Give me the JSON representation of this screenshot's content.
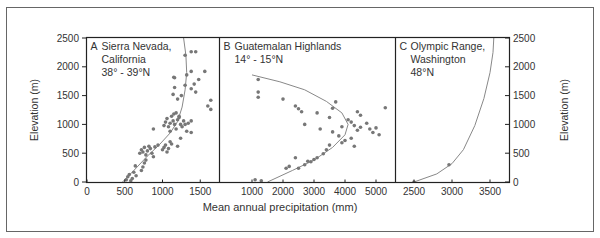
{
  "figure": {
    "xlabel": "Mean annual precipitation (mm)",
    "ylabel_left": "Elevation (m)",
    "ylabel_right": "Elevation (m)",
    "y_ticks": [
      0,
      500,
      1000,
      1500,
      2000,
      2500
    ],
    "colors": {
      "frame": "#555555",
      "axis": "#222222",
      "point": "#777777",
      "curve": "#888888",
      "text": "#333333"
    }
  },
  "chart_data": [
    {
      "type": "scatter",
      "panel": "A",
      "title": "Sierra Nevada, California",
      "subtitle": "38° - 39°N",
      "xlabel": "Mean annual precipitation (mm)",
      "ylabel": "Elevation (m)",
      "xlim": [
        0,
        1750
      ],
      "ylim": [
        0,
        2500
      ],
      "x_ticks": [
        0,
        500,
        1000,
        1500
      ],
      "y_ticks": [
        0,
        500,
        1000,
        1500,
        2000,
        2500
      ],
      "points": [
        [
          520,
          40
        ],
        [
          540,
          90
        ],
        [
          560,
          130
        ],
        [
          580,
          20
        ],
        [
          600,
          60
        ],
        [
          620,
          170
        ],
        [
          650,
          110
        ],
        [
          640,
          280
        ],
        [
          720,
          200
        ],
        [
          740,
          260
        ],
        [
          760,
          330
        ],
        [
          780,
          380
        ],
        [
          700,
          500
        ],
        [
          720,
          560
        ],
        [
          740,
          520
        ],
        [
          760,
          600
        ],
        [
          780,
          470
        ],
        [
          800,
          540
        ],
        [
          820,
          620
        ],
        [
          840,
          580
        ],
        [
          860,
          500
        ],
        [
          880,
          440
        ],
        [
          900,
          610
        ],
        [
          940,
          640
        ],
        [
          1000,
          560
        ],
        [
          1020,
          600
        ],
        [
          1040,
          640
        ],
        [
          1060,
          520
        ],
        [
          1080,
          580
        ],
        [
          1100,
          700
        ],
        [
          1120,
          660
        ],
        [
          1200,
          620
        ],
        [
          1240,
          760
        ],
        [
          880,
          920
        ],
        [
          1020,
          980
        ],
        [
          1040,
          1040
        ],
        [
          1060,
          1100
        ],
        [
          1080,
          960
        ],
        [
          1100,
          1020
        ],
        [
          1100,
          880
        ],
        [
          1120,
          1140
        ],
        [
          1140,
          1060
        ],
        [
          1160,
          1000
        ],
        [
          1180,
          920
        ],
        [
          1200,
          1080
        ],
        [
          1220,
          1120
        ],
        [
          1240,
          1000
        ],
        [
          1260,
          960
        ],
        [
          1280,
          1060
        ],
        [
          1300,
          1000
        ],
        [
          1340,
          1020
        ],
        [
          1380,
          1060
        ],
        [
          1320,
          880
        ],
        [
          1380,
          860
        ],
        [
          1150,
          1180
        ],
        [
          1180,
          1200
        ],
        [
          1220,
          1140
        ],
        [
          1250,
          1500
        ],
        [
          1200,
          1440
        ],
        [
          1140,
          1520
        ],
        [
          1160,
          1640
        ],
        [
          1300,
          1680
        ],
        [
          1380,
          1620
        ],
        [
          1420,
          1700
        ],
        [
          1440,
          1560
        ],
        [
          1480,
          1780
        ],
        [
          1560,
          1920
        ],
        [
          1600,
          1320
        ],
        [
          1640,
          1260
        ],
        [
          1640,
          1420
        ],
        [
          1150,
          1820
        ],
        [
          1160,
          1810
        ],
        [
          1320,
          1860
        ],
        [
          1380,
          1920
        ],
        [
          1300,
          2200
        ],
        [
          1380,
          2260
        ],
        [
          1440,
          2260
        ]
      ],
      "curve": [
        [
          470,
          0
        ],
        [
          620,
          200
        ],
        [
          800,
          450
        ],
        [
          960,
          650
        ],
        [
          1100,
          850
        ],
        [
          1200,
          1050
        ],
        [
          1260,
          1300
        ],
        [
          1300,
          1600
        ],
        [
          1320,
          1900
        ],
        [
          1310,
          2200
        ],
        [
          1280,
          2500
        ]
      ]
    },
    {
      "type": "scatter",
      "panel": "B",
      "title": "Guatemalan Highlands",
      "subtitle": "14° - 15°N",
      "xlabel": "Mean annual precipitation (mm)",
      "ylabel": "Elevation (m)",
      "xlim": [
        0,
        5600
      ],
      "ylim": [
        0,
        2500
      ],
      "x_ticks": [
        1000,
        2000,
        3000,
        4000,
        5000
      ],
      "y_ticks": [
        0,
        500,
        1000,
        1500,
        2000,
        2500
      ],
      "points": [
        [
          1200,
          1780
        ],
        [
          1200,
          1560
        ],
        [
          1200,
          1470
        ],
        [
          2000,
          1440
        ],
        [
          2400,
          1320
        ],
        [
          2500,
          1270
        ],
        [
          2600,
          1220
        ],
        [
          3100,
          1200
        ],
        [
          3500,
          1120
        ],
        [
          3600,
          1280
        ],
        [
          3700,
          1390
        ],
        [
          4400,
          1220
        ],
        [
          4500,
          1160
        ],
        [
          5300,
          1290
        ],
        [
          2700,
          1000
        ],
        [
          3200,
          920
        ],
        [
          3600,
          870
        ],
        [
          3800,
          800
        ],
        [
          3900,
          960
        ],
        [
          4100,
          1080
        ],
        [
          4200,
          1040
        ],
        [
          4300,
          980
        ],
        [
          4400,
          900
        ],
        [
          4500,
          950
        ],
        [
          4700,
          1020
        ],
        [
          4800,
          920
        ],
        [
          4900,
          860
        ],
        [
          5000,
          940
        ],
        [
          5100,
          820
        ],
        [
          4200,
          760
        ],
        [
          4000,
          720
        ],
        [
          3900,
          680
        ],
        [
          4300,
          620
        ],
        [
          3500,
          640
        ],
        [
          3400,
          560
        ],
        [
          3300,
          490
        ],
        [
          3100,
          420
        ],
        [
          3000,
          390
        ],
        [
          2900,
          350
        ],
        [
          2800,
          360
        ],
        [
          2700,
          300
        ],
        [
          2500,
          240
        ],
        [
          2400,
          420
        ],
        [
          2200,
          270
        ],
        [
          2100,
          240
        ],
        [
          1100,
          40
        ],
        [
          1300,
          20
        ]
      ],
      "curve": [
        [
          1500,
          0
        ],
        [
          2300,
          200
        ],
        [
          3000,
          380
        ],
        [
          3600,
          600
        ],
        [
          4000,
          820
        ],
        [
          4100,
          1000
        ],
        [
          3900,
          1200
        ],
        [
          3400,
          1400
        ],
        [
          2700,
          1600
        ],
        [
          1900,
          1740
        ],
        [
          1000,
          1860
        ]
      ]
    },
    {
      "type": "scatter",
      "panel": "C",
      "title": "Olympic Range, Washington",
      "subtitle": "48°N",
      "xlabel": "Mean annual precipitation (mm)",
      "ylabel": "Elevation (m)",
      "xlim": [
        2250,
        3750
      ],
      "ylim": [
        0,
        2500
      ],
      "x_ticks": [
        2500,
        3000,
        3500
      ],
      "y_ticks": [
        0,
        500,
        1000,
        1500,
        2000,
        2500
      ],
      "points": [
        [
          2500,
          0
        ],
        [
          2960,
          300
        ]
      ],
      "curve": [
        [
          2500,
          0
        ],
        [
          2800,
          140
        ],
        [
          3000,
          320
        ],
        [
          3150,
          560
        ],
        [
          3300,
          980
        ],
        [
          3420,
          1450
        ],
        [
          3500,
          1900
        ],
        [
          3540,
          2250
        ],
        [
          3550,
          2500
        ]
      ]
    }
  ]
}
